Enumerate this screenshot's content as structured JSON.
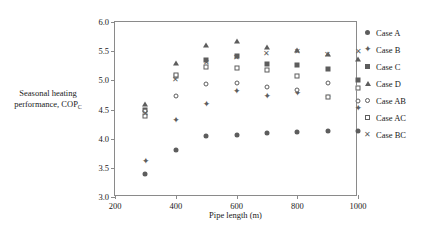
{
  "chart_data": {
    "type": "scatter",
    "title": "",
    "xlabel": "Pipe length (m)",
    "ylabel": "Seasonal heating performance, COP",
    "ylabel_subscript": "C",
    "xlim": [
      200,
      1000
    ],
    "ylim": [
      3.0,
      6.0
    ],
    "xticks": [
      200,
      400,
      600,
      800,
      1000
    ],
    "xtick_labels": [
      "200",
      "400",
      "600",
      "800",
      "1000"
    ],
    "yticks": [
      3.0,
      3.5,
      4.0,
      4.5,
      5.0,
      5.5,
      6.0
    ],
    "ytick_labels": [
      "3.0",
      "3.5",
      "4.0",
      "4.5",
      "5.0",
      "5.5",
      "6.0"
    ],
    "grid": false,
    "legend_position": "right",
    "marker_color": "#5d5d5d",
    "x": [
      300,
      400,
      500,
      600,
      700,
      800,
      900,
      1000
    ],
    "series": [
      {
        "name": "Case A",
        "marker": "filled-circle",
        "values": [
          3.4,
          3.81,
          4.05,
          4.06,
          4.1,
          4.12,
          4.14,
          4.14
        ]
      },
      {
        "name": "Case B",
        "marker": "star",
        "values": [
          3.62,
          4.32,
          4.59,
          4.82,
          4.74,
          4.79,
          4.72,
          4.53
        ]
      },
      {
        "name": "Case C",
        "marker": "filled-square",
        "values": [
          4.5,
          5.08,
          5.35,
          5.41,
          5.28,
          5.26,
          5.19,
          5.01
        ]
      },
      {
        "name": "Case D",
        "marker": "filled-triangle",
        "values": [
          4.6,
          5.3,
          5.6,
          5.68,
          5.58,
          5.52,
          5.45,
          5.36
        ]
      },
      {
        "name": "Case AB",
        "marker": "open-circle",
        "values": [
          4.47,
          4.74,
          4.94,
          4.95,
          4.89,
          4.83,
          4.95,
          4.65
        ]
      },
      {
        "name": "Case AC",
        "marker": "open-square",
        "values": [
          4.39,
          5.1,
          5.23,
          5.22,
          5.18,
          5.08,
          4.72,
          4.87
        ]
      },
      {
        "name": "Case BC",
        "marker": "cross",
        "values": [
          4.44,
          5.02,
          5.32,
          5.4,
          5.47,
          5.5,
          5.45,
          5.5
        ]
      }
    ]
  },
  "legend": {
    "items": [
      {
        "label": "Case A",
        "marker": "filled-circle"
      },
      {
        "label": "Case B",
        "marker": "star"
      },
      {
        "label": "Case C",
        "marker": "filled-square"
      },
      {
        "label": "Case D",
        "marker": "filled-triangle"
      },
      {
        "label": "Case AB",
        "marker": "open-circle"
      },
      {
        "label": "Case AC",
        "marker": "open-square"
      },
      {
        "label": "Case BC",
        "marker": "cross"
      }
    ]
  },
  "glyphs": {
    "star": "✦",
    "cross": "✕"
  }
}
